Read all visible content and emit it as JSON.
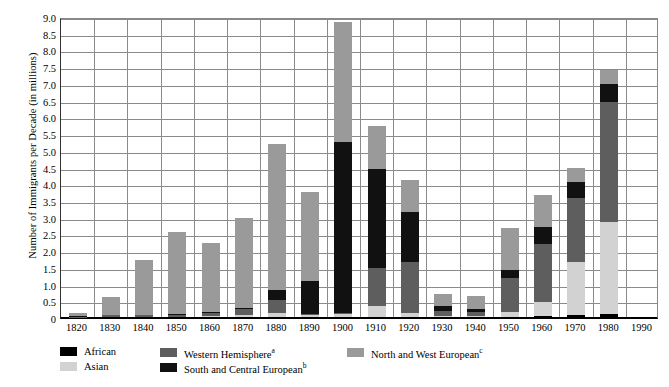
{
  "axes": {
    "ylabel": "Number of Immigrants per Decade (in millions)",
    "yticks": [
      "0",
      "0.5",
      "1.0",
      "1.5",
      "2.0",
      "2.5",
      "3.0",
      "3.5",
      "4.0",
      "4.5",
      "5.0",
      "5.5",
      "6.0",
      "6.5",
      "7.0",
      "7.5",
      "8.0",
      "8.5",
      "9.0"
    ],
    "ytick_values": [
      0,
      0.5,
      1.0,
      1.5,
      2.0,
      2.5,
      3.0,
      3.5,
      4.0,
      4.5,
      5.0,
      5.5,
      6.0,
      6.5,
      7.0,
      7.5,
      8.0,
      8.5,
      9.0
    ],
    "ymin": 0,
    "ymax": 9.0,
    "xticks": [
      "1820",
      "1830",
      "1840",
      "1850",
      "1860",
      "1870",
      "1880",
      "1890",
      "1900",
      "1910",
      "1920",
      "1930",
      "1940",
      "1950",
      "1960",
      "1970",
      "1980",
      "1990"
    ]
  },
  "legend": [
    {
      "label": "African",
      "color": "#000000",
      "name": "legend-african"
    },
    {
      "label": "Asian",
      "color": "#d2d2d2",
      "name": "legend-asian"
    },
    {
      "label": "Western Hemisphere",
      "sup": "a",
      "color": "#5e5e5e",
      "name": "legend-western-hemisphere"
    },
    {
      "label": "South and Central European",
      "sup": "b",
      "color": "#111111",
      "name": "legend-south-central-european"
    },
    {
      "label": "North and West European",
      "sup": "c",
      "color": "#9a9a9a",
      "name": "legend-north-west-european"
    }
  ],
  "colors": {
    "african": "#000000",
    "asian": "#d2d2d2",
    "western_hemisphere": "#5e5e5e",
    "south_central_european": "#111111",
    "north_west_european": "#9a9a9a",
    "grid": "#8a8a8a",
    "axis": "#000000",
    "background": "#ffffff"
  },
  "chart_data": {
    "type": "bar",
    "stacked": true,
    "title": "",
    "xlabel": "",
    "ylabel": "Number of Immigrants per Decade (in millions)",
    "ylim": [
      0,
      9.0
    ],
    "grid": true,
    "legend_position": "bottom",
    "categories": [
      "1820",
      "1830",
      "1840",
      "1850",
      "1860",
      "1870",
      "1880",
      "1890",
      "1900",
      "1910",
      "1920",
      "1930",
      "1940",
      "1950",
      "1960",
      "1970",
      "1980",
      "1990"
    ],
    "series": [
      {
        "name": "African",
        "color": "#000000",
        "values": [
          0.0,
          0.0,
          0.0,
          0.0,
          0.0,
          0.0,
          0.0,
          0.0,
          0.01,
          0.01,
          0.01,
          0.0,
          0.0,
          0.01,
          0.03,
          0.06,
          0.09,
          0.0
        ]
      },
      {
        "name": "Asian",
        "color": "#d2d2d2",
        "values": [
          0.0,
          0.0,
          0.0,
          0.0,
          0.04,
          0.06,
          0.12,
          0.06,
          0.08,
          0.32,
          0.11,
          0.03,
          0.02,
          0.15,
          0.43,
          1.59,
          2.74,
          0.0
        ]
      },
      {
        "name": "Western Hemisphere",
        "color": "#5e5e5e",
        "values": [
          0.01,
          0.06,
          0.06,
          0.07,
          0.07,
          0.17,
          0.4,
          0.04,
          0.04,
          1.14,
          1.52,
          0.16,
          0.12,
          1.0,
          1.72,
          1.9,
          3.6,
          0.0
        ]
      },
      {
        "name": "South and Central European",
        "color": "#111111",
        "values": [
          0.02,
          0.0,
          0.0,
          0.02,
          0.04,
          0.03,
          0.3,
          0.98,
          5.1,
          2.95,
          1.5,
          0.13,
          0.09,
          0.25,
          0.5,
          0.48,
          0.55,
          0.0
        ]
      },
      {
        "name": "North and West European",
        "color": "#9a9a9a",
        "values": [
          0.1,
          0.53,
          1.65,
          2.45,
          2.05,
          2.7,
          4.35,
          2.65,
          3.6,
          1.3,
          0.95,
          0.36,
          0.41,
          1.25,
          0.98,
          0.42,
          0.42,
          0.0
        ]
      }
    ],
    "totals": [
      0.13,
      0.6,
      1.71,
      2.54,
      2.2,
      2.96,
      5.17,
      3.73,
      8.83,
      5.72,
      4.09,
      0.68,
      1.04,
      2.66,
      3.27,
      4.45,
      7.4,
      0.0
    ]
  }
}
